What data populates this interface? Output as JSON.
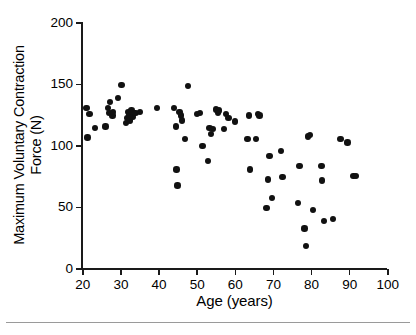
{
  "chart_data": {
    "type": "scatter",
    "title": "",
    "xlabel": "Age (years)",
    "ylabel_line1": "Maximum Voluntary Contraction",
    "ylabel_line2": "Force (N)",
    "xlim": [
      20,
      100
    ],
    "ylim": [
      0,
      200
    ],
    "xticks": [
      20,
      30,
      40,
      50,
      60,
      70,
      80,
      90,
      100
    ],
    "yticks": [
      0,
      50,
      100,
      150,
      200
    ],
    "xtick_labels": [
      "20",
      "30",
      "40",
      "50",
      "60",
      "70",
      "80",
      "90",
      "100"
    ],
    "ytick_labels": [
      "0",
      "50",
      "100",
      "150",
      "200"
    ],
    "grid": false,
    "legend": "none",
    "marker": "filled-circle",
    "marker_color": "#111111",
    "series": [
      {
        "name": "Maximum Voluntary Contraction Force",
        "points": [
          [
            21.2,
            130
          ],
          [
            21.4,
            106
          ],
          [
            22.0,
            125
          ],
          [
            23.4,
            114
          ],
          [
            26.2,
            115
          ],
          [
            26.8,
            130
          ],
          [
            27.2,
            126
          ],
          [
            27.4,
            135
          ],
          [
            28.0,
            124
          ],
          [
            28.2,
            127
          ],
          [
            29.4,
            138
          ],
          [
            30.4,
            149
          ],
          [
            31.6,
            118
          ],
          [
            31.8,
            122
          ],
          [
            32.2,
            127
          ],
          [
            32.4,
            124
          ],
          [
            32.6,
            120
          ],
          [
            33.0,
            128
          ],
          [
            33.2,
            123
          ],
          [
            34.0,
            126
          ],
          [
            35.2,
            127
          ],
          [
            39.6,
            130
          ],
          [
            44.2,
            130
          ],
          [
            44.6,
            115
          ],
          [
            44.8,
            80
          ],
          [
            45.0,
            67
          ],
          [
            45.6,
            127
          ],
          [
            46.0,
            124
          ],
          [
            46.2,
            120
          ],
          [
            47.0,
            105
          ],
          [
            47.8,
            148
          ],
          [
            50.2,
            125
          ],
          [
            51.0,
            126
          ],
          [
            51.6,
            99
          ],
          [
            53.0,
            87
          ],
          [
            53.4,
            114
          ],
          [
            53.8,
            109
          ],
          [
            54.4,
            113
          ],
          [
            55.2,
            129
          ],
          [
            55.6,
            126
          ],
          [
            56.0,
            128
          ],
          [
            57.2,
            113
          ],
          [
            57.8,
            125
          ],
          [
            58.4,
            122
          ],
          [
            60.2,
            119
          ],
          [
            63.4,
            105
          ],
          [
            63.8,
            124
          ],
          [
            64.0,
            80
          ],
          [
            65.6,
            105
          ],
          [
            66.2,
            125
          ],
          [
            66.6,
            124
          ],
          [
            68.4,
            49
          ],
          [
            68.8,
            72
          ],
          [
            69.2,
            91
          ],
          [
            69.8,
            57
          ],
          [
            72.2,
            95
          ],
          [
            72.6,
            74
          ],
          [
            76.6,
            53
          ],
          [
            77.0,
            83
          ],
          [
            78.4,
            32
          ],
          [
            78.8,
            18
          ],
          [
            79.2,
            107
          ],
          [
            79.8,
            108
          ],
          [
            80.6,
            47
          ],
          [
            82.8,
            83
          ],
          [
            83.0,
            71
          ],
          [
            83.4,
            38
          ],
          [
            85.8,
            40
          ],
          [
            87.8,
            105
          ],
          [
            89.6,
            102
          ],
          [
            91.2,
            75
          ],
          [
            91.8,
            75
          ]
        ]
      }
    ]
  }
}
